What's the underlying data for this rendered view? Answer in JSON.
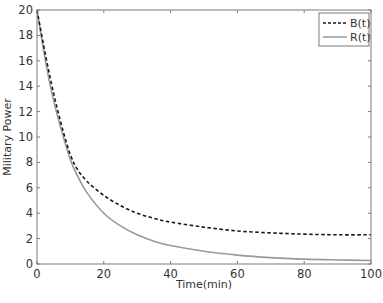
{
  "chart_data": {
    "type": "line",
    "title": "",
    "xlabel": "Time(min)",
    "ylabel": "Military Power",
    "xlim": [
      0,
      100
    ],
    "ylim": [
      0,
      20
    ],
    "xticks": [
      0,
      20,
      40,
      60,
      80,
      100
    ],
    "yticks": [
      0,
      2,
      4,
      6,
      8,
      10,
      12,
      14,
      16,
      18,
      20
    ],
    "grid": false,
    "legend_position": "upper right",
    "x": [
      0,
      2,
      4,
      6,
      8,
      10,
      12,
      15,
      20,
      25,
      30,
      35,
      40,
      50,
      60,
      70,
      80,
      90,
      100
    ],
    "series": [
      {
        "name": "B(t)",
        "style": "dashed",
        "color": "#1a1a1a",
        "values": [
          20,
          17.2,
          14.6,
          12.3,
          10.3,
          8.6,
          7.5,
          6.5,
          5.4,
          4.6,
          4.0,
          3.6,
          3.3,
          2.9,
          2.6,
          2.45,
          2.35,
          2.3,
          2.3
        ]
      },
      {
        "name": "R(t)",
        "style": "solid",
        "color": "#999999",
        "values": [
          20,
          16.8,
          14.0,
          11.8,
          9.9,
          8.2,
          7.0,
          5.6,
          4.0,
          3.0,
          2.3,
          1.8,
          1.45,
          1.0,
          0.7,
          0.5,
          0.38,
          0.32,
          0.28
        ]
      }
    ]
  }
}
